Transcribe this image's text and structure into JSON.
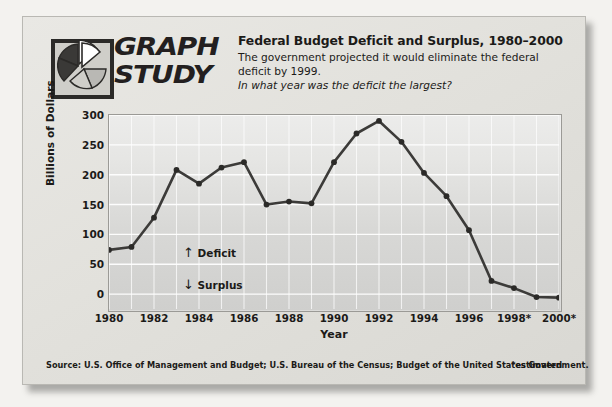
{
  "logo": {
    "line1": "GRAPH",
    "line2": "STUDY",
    "icon": "pie-chart-icon"
  },
  "header": {
    "title": "Federal Budget Deficit and Surplus, 1980–2000",
    "subtitle": "The government projected it would eliminate the federal deficit by 1999.",
    "question": "In what year was the deficit the largest?"
  },
  "annotations": {
    "deficit": "Deficit",
    "deficit_arrow": "↑",
    "surplus": "Surplus",
    "surplus_arrow": "↓"
  },
  "footer": {
    "source": "Source: U.S. Office of Management and Budget; U.S. Bureau of the Census; Budget of the United States Government.",
    "estimated_note": "*estimated"
  },
  "colors": {
    "line": "#3c3b39",
    "marker": "#2b2a28",
    "plot_bg_top": "#ececeb",
    "plot_bg_bottom": "#cfcfcd",
    "gridline": "#ffffff",
    "card_bg": "#e5e4df",
    "text": "#1b1a18"
  },
  "chart_data": {
    "type": "line",
    "title": "Federal Budget Deficit and Surplus, 1980–2000",
    "xlabel": "Year",
    "ylabel": "Billions of Dollars",
    "ylim": [
      -25,
      300
    ],
    "yticks": [
      0,
      50,
      100,
      150,
      200,
      250,
      300
    ],
    "ytick_labels": [
      "0",
      "50",
      "100",
      "150",
      "200",
      "250",
      "300"
    ],
    "xlim": [
      1980,
      2000
    ],
    "xticks": [
      1980,
      1982,
      1984,
      1986,
      1988,
      1990,
      1992,
      1994,
      1996,
      1998,
      2000
    ],
    "xtick_labels": [
      "1980",
      "1982",
      "1984",
      "1986",
      "1988",
      "1990",
      "1992",
      "1994",
      "1996",
      "1998*",
      "2000*"
    ],
    "grid": true,
    "legend": false,
    "x": [
      1980,
      1981,
      1982,
      1983,
      1984,
      1985,
      1986,
      1987,
      1988,
      1989,
      1990,
      1991,
      1992,
      1993,
      1994,
      1995,
      1996,
      1997,
      1998,
      1999,
      2000
    ],
    "values": [
      74,
      79,
      128,
      208,
      185,
      212,
      221,
      150,
      155,
      152,
      221,
      269,
      290,
      255,
      203,
      164,
      107,
      22,
      10,
      -5,
      -6
    ],
    "markers": true,
    "estimated_years": [
      1998,
      1999,
      2000
    ],
    "peak": {
      "year": 1992,
      "value": 290
    },
    "annotations": [
      "↑ Deficit",
      "↓ Surplus"
    ]
  }
}
